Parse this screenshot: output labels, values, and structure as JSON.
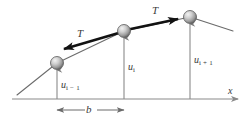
{
  "figure": {
    "type": "physics-diagram",
    "labels": {
      "tension_left": "T",
      "tension_right": "T",
      "displacement_left_main": "u",
      "displacement_left_sub": "i − 1",
      "displacement_mid_main": "u",
      "displacement_mid_sub": "i",
      "displacement_right_main": "u",
      "displacement_right_sub": "i + 1",
      "spacing": "b",
      "axis_x": "x"
    },
    "colors": {
      "line": "#6b6b6b",
      "axis": "#8a8a8a",
      "tension_arrow": "#1a1a1a",
      "bead_highlight": "#e8e8e8",
      "bead_mid": "#9a9a9a",
      "bead_shadow": "#5a5a5a",
      "text": "#3a3a3a",
      "background": "#ffffff"
    },
    "geometry": {
      "baseline_y": 99,
      "bead_left": {
        "x": 57,
        "y": 63,
        "r": 6.5
      },
      "bead_mid": {
        "x": 124,
        "y": 31,
        "r": 6.5
      },
      "bead_right": {
        "x": 190,
        "y": 17,
        "r": 6.5
      },
      "string_start": {
        "x": 17,
        "y": 95
      },
      "string_end": {
        "x": 233,
        "y": 31
      },
      "spacing_from_x": 57,
      "spacing_to_x": 124,
      "spacing_y": 110,
      "axis_start_x": 12,
      "axis_end_x": 240
    }
  }
}
